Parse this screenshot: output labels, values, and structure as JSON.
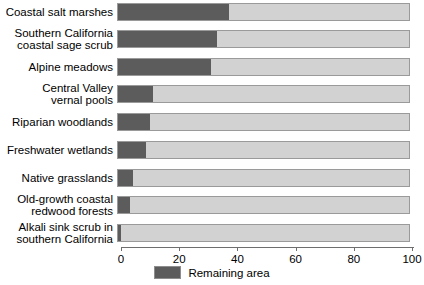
{
  "chart_data": {
    "type": "bar",
    "orientation": "horizontal",
    "title": "",
    "subtitle": "",
    "xlabel": "",
    "ylabel": "",
    "xlim": [
      0,
      100
    ],
    "xticks": [
      0,
      20,
      40,
      60,
      80,
      100
    ],
    "xtick_labels": [
      "0",
      "20",
      "40",
      "60",
      "80",
      "100"
    ],
    "grid": false,
    "stacked": true,
    "total": 100,
    "legend": {
      "position": "bottom-center",
      "entries": [
        {
          "label": "Remaining area",
          "color": "#5c5c5c"
        }
      ]
    },
    "colors": {
      "remaining": "#5c5c5c",
      "lost": "#d2d2d2",
      "bar_border": "#9a9a9a",
      "axis": "#6e6e6e",
      "text": "#000000",
      "background": "#ffffff"
    },
    "categories": [
      "Coastal salt marshes",
      "Southern California\ncoastal sage scrub",
      "Alpine meadows",
      "Central Valley\nvernal pools",
      "Riparian woodlands",
      "Freshwater wetlands",
      "Native grasslands",
      "Old-growth coastal\nredwood forests",
      "Alkali sink scrub in\nsouthern California"
    ],
    "series": [
      {
        "name": "Remaining area",
        "color": "#5c5c5c",
        "values": [
          38,
          34,
          32,
          12,
          11,
          9.5,
          5,
          4,
          1
        ]
      }
    ],
    "rows": [
      {
        "label": "Coastal salt marshes",
        "remaining": 38,
        "top": 3,
        "height": 18
      },
      {
        "label": "Southern California\ncoastal sage scrub",
        "remaining": 34,
        "top": 30,
        "height": 18
      },
      {
        "label": "Alpine meadows",
        "remaining": 32,
        "top": 58,
        "height": 18
      },
      {
        "label": "Central Valley\nvernal pools",
        "remaining": 12,
        "top": 85,
        "height": 18
      },
      {
        "label": "Riparian woodlands",
        "remaining": 11,
        "top": 113,
        "height": 18
      },
      {
        "label": "Freshwater wetlands",
        "remaining": 9.5,
        "top": 141,
        "height": 18
      },
      {
        "label": "Native grasslands",
        "remaining": 5,
        "top": 169,
        "height": 18
      },
      {
        "label": "Old-growth coastal\nredwood forests",
        "remaining": 4,
        "top": 196,
        "height": 18
      },
      {
        "label": "Alkali sink scrub in\nsouthern California",
        "remaining": 1,
        "top": 224,
        "height": 18
      }
    ]
  },
  "legend": {
    "swatch_name": "remaining-area-swatch",
    "label": "Remaining area"
  },
  "axis": {
    "ticks": [
      "0",
      "20",
      "40",
      "60",
      "80",
      "100"
    ]
  }
}
